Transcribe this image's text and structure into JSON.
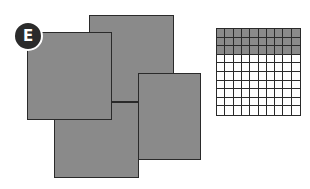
{
  "figure": {
    "label": "E",
    "colors": {
      "shade": "#8a8a8a",
      "outline": "#2a2a2a",
      "badge": "#2b2b2b",
      "background": "#ffffff"
    },
    "squares": [
      {
        "id": "top-back",
        "left": 89,
        "top": 15,
        "width": 85,
        "height": 87
      },
      {
        "id": "right",
        "left": 138,
        "top": 73,
        "width": 63,
        "height": 87
      },
      {
        "id": "bottom",
        "left": 54,
        "top": 102,
        "width": 85,
        "height": 76
      },
      {
        "id": "left-front",
        "left": 27,
        "top": 32,
        "width": 85,
        "height": 88
      }
    ],
    "grid": {
      "rows": 10,
      "cols": 10,
      "shaded_rows": 3,
      "shaded_cells": 30,
      "total_cells": 100
    }
  }
}
